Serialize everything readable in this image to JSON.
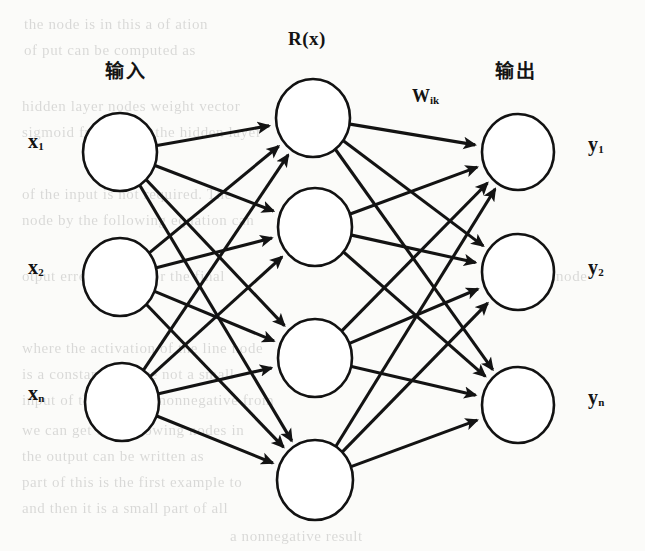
{
  "figure": {
    "type": "neural-network-diagram",
    "title_labels": {
      "input_layer": "输入",
      "output_layer": "输出",
      "activation_function": "R(x)",
      "weight_symbol": "W",
      "weight_subscript": "ik"
    },
    "layers": {
      "input": {
        "count": 3,
        "nodes": [
          {
            "label": "x",
            "subscript": "1",
            "cx": 120,
            "cy": 152,
            "r": 37
          },
          {
            "label": "x",
            "subscript": "2",
            "cx": 120,
            "cy": 277,
            "r": 37
          },
          {
            "label": "x",
            "subscript": "n",
            "cx": 122,
            "cy": 402,
            "r": 37
          }
        ]
      },
      "hidden": {
        "count": 4,
        "nodes": [
          {
            "cx": 313,
            "cy": 118,
            "r": 37
          },
          {
            "cx": 315,
            "cy": 227,
            "r": 37
          },
          {
            "cx": 315,
            "cy": 358,
            "r": 37
          },
          {
            "cx": 315,
            "cy": 480,
            "r": 38
          }
        ]
      },
      "output": {
        "count": 3,
        "nodes": [
          {
            "label": "y",
            "subscript": "1",
            "cx": 518,
            "cy": 152,
            "r": 36
          },
          {
            "label": "y",
            "subscript": "2",
            "cx": 518,
            "cy": 272,
            "r": 36
          },
          {
            "label": "y",
            "subscript": "n",
            "cx": 518,
            "cy": 405,
            "r": 36
          }
        ]
      }
    },
    "colors": {
      "ink": "#131313",
      "paper": "#fbfbf9",
      "node_fill": "#ffffff"
    }
  },
  "annotations": {
    "input_label": {
      "text": "输入",
      "x": 105,
      "y": 56
    },
    "output_label": {
      "text": "输出",
      "x": 495,
      "y": 56
    },
    "rx_label": {
      "text": "R(x)",
      "x": 288,
      "y": 28
    },
    "wik_label": {
      "text": "W",
      "sub": "ik",
      "x": 412,
      "y": 86
    },
    "x1": {
      "x": 28,
      "y": 130
    },
    "x2": {
      "x": 28,
      "y": 256
    },
    "xn": {
      "x": 28,
      "y": 382
    },
    "y1": {
      "x": 588,
      "y": 133
    },
    "y2": {
      "x": 588,
      "y": 256
    },
    "yn": {
      "x": 588,
      "y": 386
    }
  },
  "ghost_text": {
    "lines": [
      {
        "text": "the node is in  this  a  of  ation",
        "x": 24,
        "y": 16
      },
      {
        "text": "of  put  can  be  computed  as",
        "x": 24,
        "y": 42
      },
      {
        "text": "hidden  layer  nodes  weight  vector",
        "x": 22,
        "y": 98
      },
      {
        "text": "sigmoid  function  in  the  hidden  layer",
        "x": 22,
        "y": 124
      },
      {
        "text": "of  the  input  is  not  required.  The",
        "x": 22,
        "y": 186
      },
      {
        "text": "node  by  the  following  equation  can",
        "x": 22,
        "y": 212
      },
      {
        "text": "otput  error  is  used  for  the  final",
        "x": 22,
        "y": 268
      },
      {
        "text": "node",
        "x": 556,
        "y": 268
      },
      {
        "text": "where  the  activation  of  the  line  node",
        "x": 22,
        "y": 340
      },
      {
        "text": "is  a  constant.  We  are  not  a  small",
        "x": 22,
        "y": 366
      },
      {
        "text": "input  of  the  training  nonnegative  from",
        "x": 22,
        "y": 392
      },
      {
        "text": "we  can  get  the  following  nodes  in",
        "x": 22,
        "y": 422
      },
      {
        "text": "the  output  can  be  written  as",
        "x": 22,
        "y": 448
      },
      {
        "text": "part  of  this  is  the  first  example  to",
        "x": 22,
        "y": 474
      },
      {
        "text": "and  then  it  is  a  small  part  of  all",
        "x": 22,
        "y": 500
      },
      {
        "text": "a  nonnegative  result",
        "x": 230,
        "y": 528
      }
    ]
  }
}
